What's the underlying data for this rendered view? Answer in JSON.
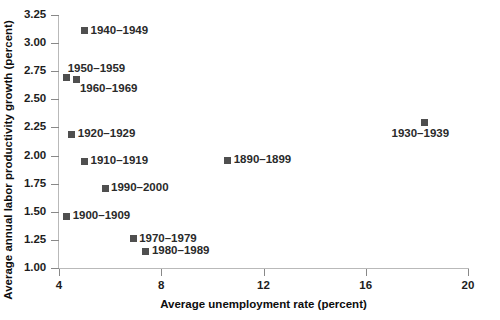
{
  "chart_data": {
    "type": "scatter",
    "title": "",
    "xlabel": "Average unemployment rate (percent)",
    "ylabel": "Average annual labor productivity growth (percent)",
    "xlim": [
      4,
      20
    ],
    "ylim": [
      1.0,
      3.25
    ],
    "xticks": [
      "4",
      "8",
      "12",
      "16",
      "20"
    ],
    "xtick_values": [
      4,
      8,
      12,
      16,
      20
    ],
    "yticks": [
      "1.00",
      "1.25",
      "1.50",
      "1.75",
      "2.00",
      "2.25",
      "2.50",
      "2.75",
      "3.00",
      "3.25"
    ],
    "ytick_values": [
      1.0,
      1.25,
      1.5,
      1.75,
      2.0,
      2.25,
      2.5,
      2.75,
      3.0,
      3.25
    ],
    "grid": false,
    "legend": "none",
    "marker_color": "#4f4f4f",
    "axis_color": "#b9b9b9",
    "points": [
      {
        "label": "1940–1949",
        "x": 5.0,
        "y": 3.11,
        "label_pos": "right"
      },
      {
        "label": "1950–1959",
        "x": 4.3,
        "y": 2.69,
        "label_pos": "above-right"
      },
      {
        "label": "1960–1969",
        "x": 4.7,
        "y": 2.68,
        "label_pos": "below-right"
      },
      {
        "label": "1930–1939",
        "x": 18.3,
        "y": 2.29,
        "label_pos": "below-center"
      },
      {
        "label": "1920–1929",
        "x": 4.5,
        "y": 2.19,
        "label_pos": "right"
      },
      {
        "label": "1890–1899",
        "x": 10.6,
        "y": 1.96,
        "label_pos": "right"
      },
      {
        "label": "1910–1919",
        "x": 5.0,
        "y": 1.95,
        "label_pos": "right"
      },
      {
        "label": "1990–2000",
        "x": 5.8,
        "y": 1.71,
        "label_pos": "right"
      },
      {
        "label": "1900–1909",
        "x": 4.3,
        "y": 1.46,
        "label_pos": "right"
      },
      {
        "label": "1970–1979",
        "x": 6.9,
        "y": 1.26,
        "label_pos": "right"
      },
      {
        "label": "1980–1989",
        "x": 7.4,
        "y": 1.15,
        "label_pos": "right"
      }
    ]
  }
}
